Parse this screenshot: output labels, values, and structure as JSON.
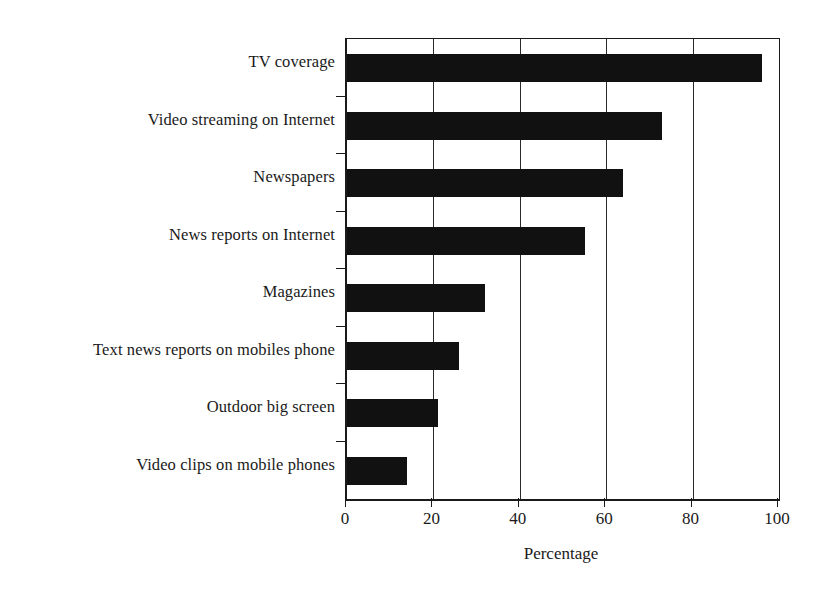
{
  "chart_data": {
    "type": "bar",
    "orientation": "horizontal",
    "title": "",
    "xlabel": "Percentage",
    "ylabel": "",
    "categories": [
      "TV coverage",
      "Video streaming on Internet",
      "Newspapers",
      "News reports on Internet",
      "Magazines",
      "Text news reports on mobiles phone",
      "Outdoor big screen",
      "Video clips on mobile phones"
    ],
    "values": [
      96,
      73,
      64,
      55,
      32,
      26,
      21,
      14
    ],
    "xlim": [
      0,
      100
    ],
    "xticks": [
      0,
      20,
      40,
      60,
      80,
      100
    ],
    "xtick_labels": [
      "0",
      "20",
      "40",
      "60",
      "80",
      "100"
    ],
    "grid": "vertical",
    "legend": "none",
    "bar_color": "#111111",
    "axis_color": "#1a1a1a",
    "background_color": "#ffffff"
  }
}
